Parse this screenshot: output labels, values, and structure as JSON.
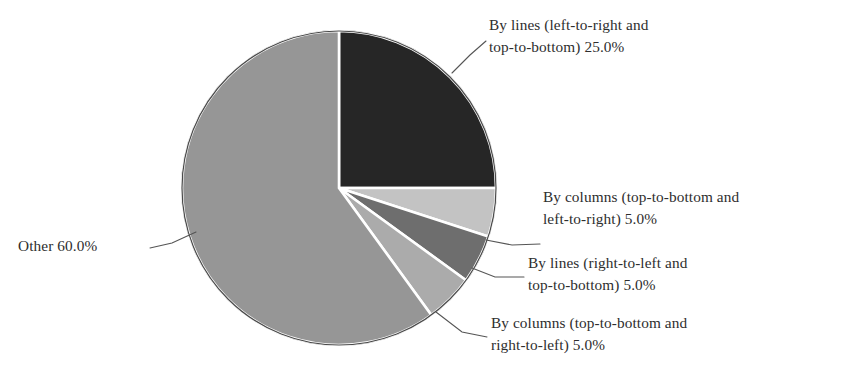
{
  "chart_data": {
    "type": "pie",
    "title": "",
    "subtitle": "",
    "xlabel": "",
    "ylabel": "",
    "legend_position": "callout-labels",
    "grid": false,
    "start_angle_deg": 0,
    "direction": "clockwise",
    "total_percent": 100.0,
    "categories": [
      "By lines (left-to-right and top-to-bottom)",
      "By columns (top-to-bottom and left-to-right)",
      "By lines (right-to-left and top-to-bottom)",
      "By columns (top-to-bottom and right-to-left)",
      "Other"
    ],
    "values": [
      25.0,
      5.0,
      5.0,
      5.0,
      60.0
    ],
    "value_labels": [
      "25.0%",
      "5.0%",
      "5.0%",
      "5.0%",
      "60.0%"
    ],
    "colors": [
      "#262626",
      "#c3c3c3",
      "#6e6e6e",
      "#ababab",
      "#969696"
    ],
    "slices": [
      {
        "name": "By lines (left-to-right and top-to-bottom)",
        "value": 25.0,
        "value_label": "25.0%",
        "color": "#262626",
        "label_line_1": "By lines (left-to-right and",
        "label_line_2": "top-to-bottom) 25.0%"
      },
      {
        "name": "By columns (top-to-bottom and left-to-right)",
        "value": 5.0,
        "value_label": "5.0%",
        "color": "#c3c3c3",
        "label_line_1": "By columns (top-to-bottom and",
        "label_line_2": "left-to-right) 5.0%"
      },
      {
        "name": "By lines (right-to-left and top-to-bottom)",
        "value": 5.0,
        "value_label": "5.0%",
        "color": "#6e6e6e",
        "label_line_1": "By lines (right-to-left and",
        "label_line_2": "top-to-bottom) 5.0%"
      },
      {
        "name": "By columns (top-to-bottom and right-to-left)",
        "value": 5.0,
        "value_label": "5.0%",
        "color": "#ababab",
        "label_line_1": "By columns (top-to-bottom and",
        "label_line_2": "right-to-left) 5.0%"
      },
      {
        "name": "Other",
        "value": 60.0,
        "value_label": "60.0%",
        "color": "#969696",
        "label_line_1": "Other 60.0%",
        "label_line_2": ""
      }
    ]
  }
}
